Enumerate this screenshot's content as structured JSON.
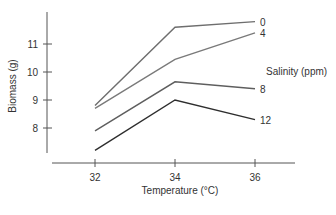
{
  "chart_data": {
    "type": "line",
    "title": "",
    "xlabel": "Temperature (°C)",
    "ylabel": "Biomass (g)",
    "x": [
      32,
      34,
      36
    ],
    "x_ticks": [
      "32",
      "34",
      "36"
    ],
    "y_ticks": [
      "8",
      "9",
      "10",
      "11"
    ],
    "ylim": [
      6.9,
      12.4
    ],
    "xlim": [
      30.4,
      37.5
    ],
    "grid": false,
    "legend_title": "Salinity (ppm)",
    "legend_position": "right, inline labels at line ends",
    "series": [
      {
        "name": "0",
        "values": [
          8.8,
          11.6,
          11.8
        ],
        "color": "#6e6e6e"
      },
      {
        "name": "4",
        "values": [
          8.7,
          10.45,
          11.4
        ],
        "color": "#7a7a7a"
      },
      {
        "name": "8",
        "values": [
          7.9,
          9.65,
          9.4
        ],
        "color": "#5e5e5e"
      },
      {
        "name": "12",
        "values": [
          7.2,
          9.0,
          8.3
        ],
        "color": "#2e2e2e"
      }
    ]
  }
}
